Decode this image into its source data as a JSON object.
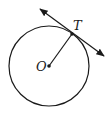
{
  "diagram": {
    "title": "",
    "type": "circle-tangent",
    "colors": {
      "stroke": "#1a1a1a",
      "background": "#ffffff"
    },
    "circle": {
      "center_label": "O",
      "cx": 49,
      "cy": 66,
      "r": 40
    },
    "point_of_tangency": {
      "label": "T",
      "x": 72,
      "y": 34
    },
    "radius_segment": {
      "from": "O",
      "to": "T"
    },
    "tangent_line": {
      "through": "T",
      "arrows": "both",
      "x1": 40,
      "y1": 9,
      "x2": 104,
      "y2": 56
    }
  }
}
